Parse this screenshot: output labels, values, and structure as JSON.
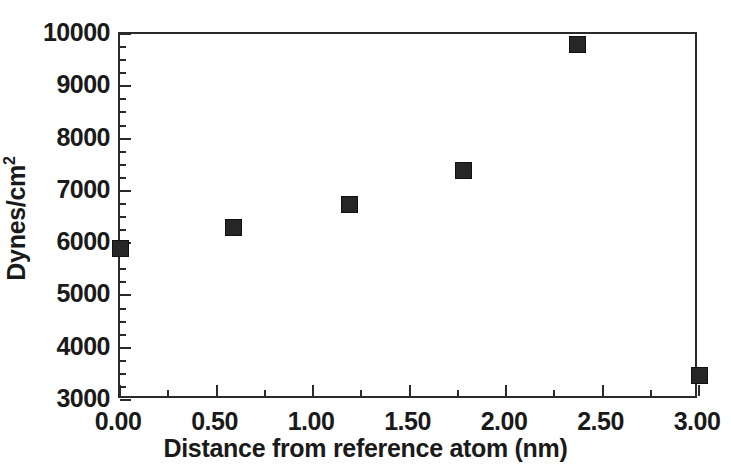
{
  "chart_data": {
    "type": "scatter",
    "title": "",
    "xlabel": "Distance from reference atom (nm)",
    "ylabel": "Dynes/cm2",
    "ylabel_base": "Dynes/cm",
    "ylabel_exponent": "2",
    "xlim": [
      0.0,
      3.0
    ],
    "ylim": [
      3000,
      10000
    ],
    "grid": false,
    "legend": null,
    "marker": "filled-square",
    "marker_color": "#262626",
    "x_major_ticks": [
      0.0,
      0.5,
      1.0,
      1.5,
      2.0,
      2.5,
      3.0
    ],
    "x_tick_labels": [
      "0.00",
      "0.50",
      "1.00",
      "1.50",
      "2.00",
      "2.50",
      "3.00"
    ],
    "x_minor_interval": 0.25,
    "y_major_ticks": [
      3000,
      4000,
      5000,
      6000,
      7000,
      8000,
      9000,
      10000
    ],
    "y_tick_labels": [
      "3000",
      "4000",
      "5000",
      "6000",
      "7000",
      "8000",
      "9000",
      "10000"
    ],
    "y_minor_interval": 250,
    "series": [
      {
        "name": "",
        "x": [
          0.0,
          0.59,
          1.19,
          1.78,
          2.37,
          3.0
        ],
        "y": [
          5900,
          6300,
          6730,
          7380,
          9790,
          3460
        ]
      }
    ]
  }
}
